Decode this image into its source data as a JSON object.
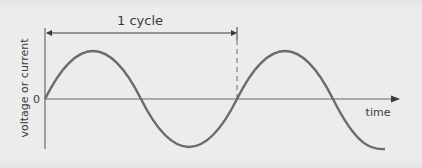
{
  "diagram": {
    "cycle_label": "1 cycle",
    "y_axis_label": "voltage or current",
    "x_axis_label": "time",
    "origin_label": "0",
    "colors": {
      "background": "#ececec",
      "wave": "#6b6b6b",
      "axis": "#6b6b6b",
      "text": "#3a3a3a"
    }
  }
}
